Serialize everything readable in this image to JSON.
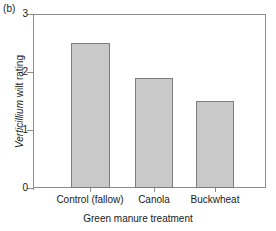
{
  "panel": {
    "label": "(b)"
  },
  "chart_data": {
    "type": "bar",
    "title": "",
    "subtitle": "",
    "panel_label": "(b)",
    "categories": [
      "Control (fallow)",
      "Canola",
      "Buckwheat"
    ],
    "values": [
      2.5,
      1.9,
      1.5
    ],
    "series": [
      {
        "name": "Verticillium wilt rating",
        "values": [
          2.5,
          1.9,
          1.5
        ]
      }
    ],
    "xlabel": "Green manure treatment",
    "ylabel": "Verticillium wilt rating",
    "ylabel_italic_part": "Verticillium",
    "ylabel_roman_part": " wilt rating",
    "ylim": [
      0,
      3
    ],
    "yticks": [
      0,
      1,
      2,
      3
    ],
    "ytick_labels": [
      "0",
      "1",
      "2",
      "3"
    ],
    "grid": false,
    "legend": false,
    "legend_position": "none",
    "bar_color": "#c9c9c9",
    "bar_edge_color": "#7d7d7d",
    "axis_color": "#8c8c8c",
    "background": "#ffffff"
  },
  "axes": {
    "y": {
      "title_italic": "Verticillium",
      "title_rest": " wilt rating",
      "ticks": [
        {
          "value": 3,
          "label": "3"
        },
        {
          "value": 2,
          "label": "2"
        },
        {
          "value": 1,
          "label": "1"
        },
        {
          "value": 0,
          "label": "0"
        }
      ]
    },
    "x": {
      "title": "Green manure treatment",
      "ticks": [
        {
          "label": "Control (fallow)"
        },
        {
          "label": "Canola"
        },
        {
          "label": "Buckwheat"
        }
      ]
    }
  }
}
